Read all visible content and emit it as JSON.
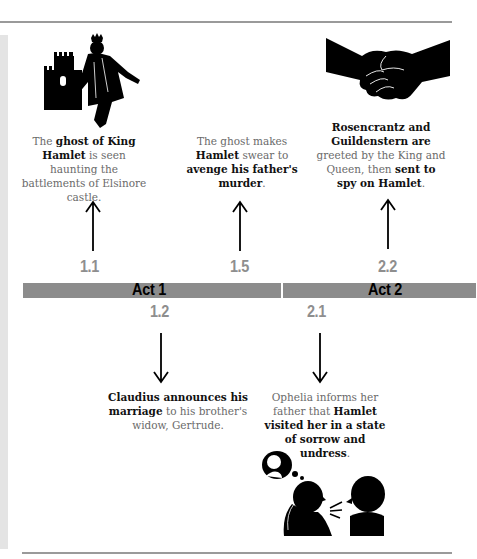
{
  "timeline": {
    "acts": [
      {
        "label": "Act 1",
        "color": "#8c8c8c"
      },
      {
        "label": "Act 2",
        "color": "#8c8c8c"
      }
    ],
    "scenes": [
      {
        "number": "1.1",
        "position": "above",
        "icon": "ghost-king-castle-icon",
        "caption": {
          "pre": "The ",
          "b1": "ghost of King Hamlet",
          "mid": " is seen haunting the battlements of Elsinore castle."
        }
      },
      {
        "number": "1.5",
        "position": "above",
        "caption": {
          "pre": "The ghost makes ",
          "b1": "Hamlet",
          "mid": " swear to ",
          "b2": "avenge his father's murder",
          "post": "."
        }
      },
      {
        "number": "2.2",
        "position": "above",
        "icon": "handshake-icon",
        "caption": {
          "b1": "Rosencrantz and Guildenstern are",
          "mid": " greeted by the King and Queen, then ",
          "b2": "sent to spy on Hamlet",
          "post": "."
        }
      },
      {
        "number": "1.2",
        "position": "below",
        "caption": {
          "b1": "Claudius announces his marriage",
          "mid": " to his brother's widow, Gertrude."
        }
      },
      {
        "number": "2.1",
        "position": "below",
        "icon": "conversation-thought-icon",
        "caption": {
          "pre": "Ophelia informs her father that ",
          "b1": "Hamlet visited her in a state of sorrow and undress",
          "post": "."
        }
      }
    ]
  },
  "colors": {
    "bar": "#8c8c8c",
    "scene_number": "#8e8e8e",
    "rule": "#9a9a9a",
    "side_strip": "#e4e4e4"
  }
}
